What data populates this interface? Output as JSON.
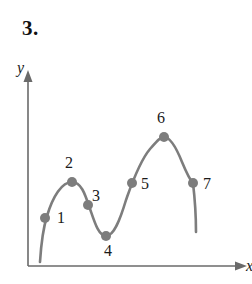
{
  "figure": {
    "problem_number": "3.",
    "axis_label_y": "y",
    "axis_label_x": "x"
  },
  "point_labels": [
    {
      "text": "1",
      "left": 57,
      "top": 210
    },
    {
      "text": "2",
      "left": 65,
      "top": 155
    },
    {
      "text": "3",
      "left": 92,
      "top": 188
    },
    {
      "text": "4",
      "left": 104,
      "top": 243
    },
    {
      "text": "5",
      "left": 141,
      "top": 176
    },
    {
      "text": "6",
      "left": 157,
      "top": 110
    },
    {
      "text": "7",
      "left": 203,
      "top": 176
    }
  ],
  "chart_data": {
    "type": "line",
    "title": "3.",
    "xlabel": "x",
    "ylabel": "y",
    "grid": false,
    "legend": null,
    "axes": {
      "origin": {
        "x": 28,
        "y": 266
      },
      "y_axis_top": 72,
      "x_axis_right": 245,
      "arrowheads": [
        "y-up",
        "x-right"
      ]
    },
    "curve": {
      "color": "#7d7d7d",
      "width": 2.6,
      "start": {
        "x": 40,
        "y": 262
      },
      "end": {
        "x": 196,
        "y": 232
      },
      "path": "M 40 262 C 41 246, 42 232, 47 216 C 53 196, 62 182, 72 182 C 81 182, 85 194, 89 206 C 94 220, 98 236, 106 236 C 114 236, 120 220, 126 200 C 131 186, 139 162, 150 149 C 157 141, 160 137, 164 137 C 170 137, 176 147, 182 162 C 187 174, 190 180, 193 183 C 195 200, 196 216, 196 232"
    },
    "points": [
      {
        "label": "1",
        "x": 45,
        "y": 218
      },
      {
        "label": "2",
        "x": 72,
        "y": 182
      },
      {
        "label": "3",
        "x": 88,
        "y": 205
      },
      {
        "label": "4",
        "x": 106,
        "y": 236
      },
      {
        "label": "5",
        "x": 132,
        "y": 183
      },
      {
        "label": "6",
        "x": 164,
        "y": 137
      },
      {
        "label": "7",
        "x": 193,
        "y": 183
      }
    ],
    "point_style": {
      "radius": 5,
      "color": "#7d7d7d"
    },
    "axis_color": "#6a6a6a"
  }
}
